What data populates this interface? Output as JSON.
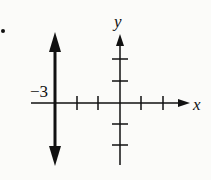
{
  "diagram": {
    "type": "number-line-graph",
    "axes": {
      "x_label": "x",
      "y_label": "y",
      "x_ticks": [
        -3,
        -2,
        -1,
        1,
        2
      ],
      "y_ticks": [
        2,
        1,
        -1,
        -2
      ]
    },
    "vertical_line": {
      "equation": "x = -3",
      "label": "−3",
      "arrows": "both"
    },
    "bullet": "•",
    "colors": {
      "ink": "#111111",
      "background": "#fbfbf9"
    }
  }
}
